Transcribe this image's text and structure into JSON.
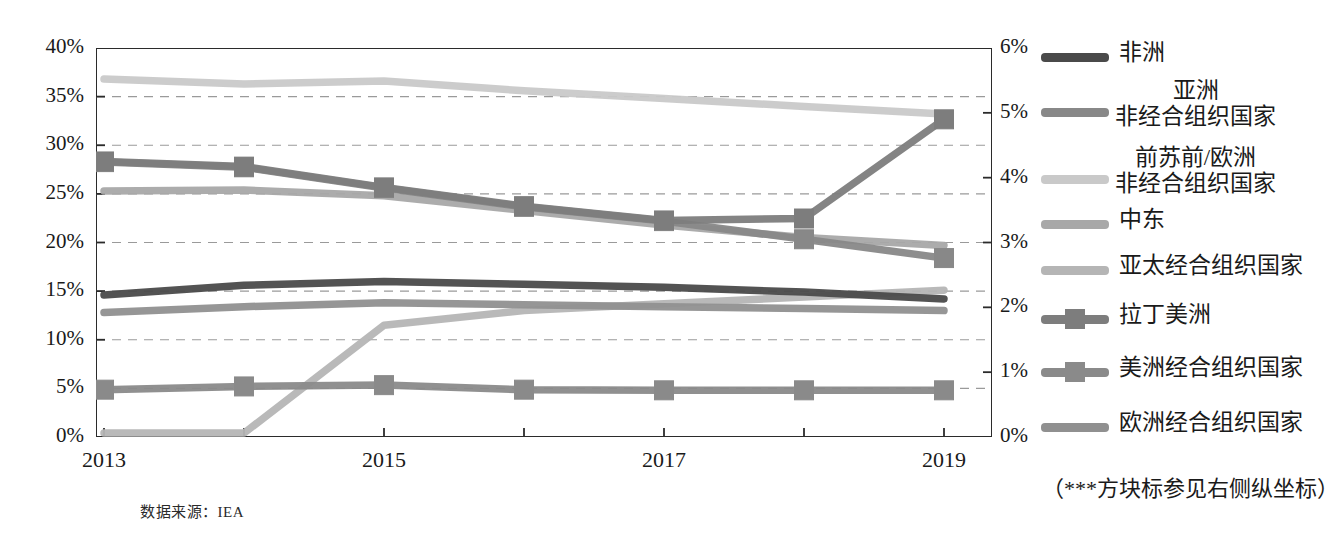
{
  "chart_data": {
    "type": "line",
    "title": "",
    "xlabel": "",
    "ylabel": "",
    "grid": true,
    "legend_position": "right",
    "x": [
      2013,
      2014,
      2015,
      2016,
      2017,
      2018,
      2019
    ],
    "xticklabels": [
      "2013",
      "",
      "2015",
      "",
      "2017",
      "",
      "2019"
    ],
    "axes": {
      "left": {
        "ticks": [
          "0%",
          "5%",
          "10%",
          "15%",
          "20%",
          "25%",
          "30%",
          "35%",
          "40%"
        ],
        "values": [
          0,
          5,
          10,
          15,
          20,
          25,
          30,
          35,
          40
        ],
        "ylim": [
          0,
          40
        ]
      },
      "right": {
        "ticks": [
          "0%",
          "1%",
          "2%",
          "3%",
          "4%",
          "5%",
          "6%"
        ],
        "values": [
          0,
          1,
          2,
          3,
          4,
          5,
          6
        ],
        "ylim": [
          0,
          6
        ],
        "note": "（***方块标参见右侧纵坐标）"
      }
    },
    "series": [
      {
        "name": "非洲",
        "axis": "left",
        "color": "#4a4a4a",
        "marker": "none",
        "values": [
          14.6,
          15.6,
          16.0,
          15.7,
          15.4,
          14.9,
          14.2
        ]
      },
      {
        "name": "亚洲\n非经合组织国家",
        "name_line1": "亚洲",
        "name_line2": "非经合组织国家",
        "axis": "right",
        "color": "#888888",
        "marker": "square",
        "values": [
          4.24,
          4.16,
          3.84,
          3.55,
          3.33,
          3.05,
          2.76
        ]
      },
      {
        "name": "前苏前/欧洲\n非经合组织国家",
        "name_line1": "前苏前/欧洲",
        "name_line2": "非经合组织国家",
        "axis": "left",
        "color": "#c9c9c9",
        "marker": "none",
        "values": [
          36.8,
          36.3,
          36.6,
          35.6,
          34.8,
          34.0,
          33.2
        ]
      },
      {
        "name": "中东",
        "axis": "left",
        "color": "#a8a8a8",
        "marker": "none",
        "values": [
          25.3,
          25.4,
          24.8,
          23.3,
          21.8,
          20.5,
          19.7
        ]
      },
      {
        "name": "亚太经合组织国家",
        "axis": "left",
        "color": "#b5b5b5",
        "marker": "none",
        "values": [
          0.4,
          0.4,
          11.5,
          13.0,
          13.7,
          14.4,
          15.1
        ]
      },
      {
        "name": "拉丁美洲",
        "axis": "right",
        "color": "#7d7d7d",
        "marker": "square",
        "values": [
          4.25,
          4.17,
          3.85,
          3.56,
          3.34,
          3.37,
          4.9
        ]
      },
      {
        "name": "美洲经合组织国家",
        "axis": "right",
        "color": "#8a8a8a",
        "marker": "square",
        "values": [
          0.73,
          0.78,
          0.8,
          0.73,
          0.72,
          0.72,
          0.72
        ]
      },
      {
        "name": "欧洲经合组织国家",
        "axis": "left",
        "color": "#909090",
        "marker": "none",
        "values": [
          12.8,
          13.4,
          13.8,
          13.6,
          13.4,
          13.2,
          13.0
        ]
      }
    ],
    "annotations": {
      "source": "数据来源：IEA"
    }
  },
  "legend": {
    "items": [
      {
        "label": "非洲",
        "lines": [
          "非洲"
        ],
        "color": "#4a4a4a",
        "marker": "line"
      },
      {
        "label": "亚洲非经合组织国家",
        "lines": [
          "亚洲",
          "非经合组织国家"
        ],
        "color": "#888888",
        "marker": "line"
      },
      {
        "label": "前苏前/欧洲非经合组织国家",
        "lines": [
          "前苏前/欧洲",
          "非经合组织国家"
        ],
        "color": "#c9c9c9",
        "marker": "line"
      },
      {
        "label": "中东",
        "lines": [
          "中东"
        ],
        "color": "#a8a8a8",
        "marker": "line"
      },
      {
        "label": "亚太经合组织国家",
        "lines": [
          "亚太经合组织国家"
        ],
        "color": "#b5b5b5",
        "marker": "line"
      },
      {
        "label": "拉丁美洲",
        "lines": [
          "拉丁美洲"
        ],
        "color": "#7d7d7d",
        "marker": "line-square"
      },
      {
        "label": "美洲经合组织国家",
        "lines": [
          "美洲经合组织国家"
        ],
        "color": "#8a8a8a",
        "marker": "line-square"
      },
      {
        "label": "欧洲经合组织国家",
        "lines": [
          "欧洲经合组织国家"
        ],
        "color": "#909090",
        "marker": "line"
      }
    ],
    "note": "（***方块标参见右侧纵坐标）"
  },
  "source_text": "数据来源：IEA"
}
